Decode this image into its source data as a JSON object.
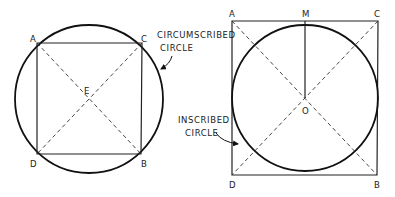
{
  "figures": {
    "circumscribed": {
      "points": {
        "A": "A",
        "B": "B",
        "C": "C",
        "D": "D",
        "center": "E"
      },
      "annotation": [
        "CIRCUMSCRIBED",
        "CIRCLE"
      ]
    },
    "inscribed": {
      "points": {
        "A": "A",
        "B": "B",
        "C": "C",
        "D": "D",
        "M": "M",
        "center": "O"
      },
      "annotation": [
        "INSCRIBED",
        "CIRCLE"
      ]
    }
  }
}
